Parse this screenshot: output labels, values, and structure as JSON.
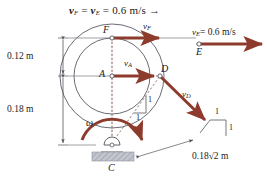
{
  "figure": {
    "title": {
      "full": "vF = vE = 0.6 m/s →",
      "v1": "v",
      "v1_sub": "F",
      "eq1": "=",
      "v2": "v",
      "v2_sub": "E",
      "eq2": "=",
      "value": "0.6 m/s →"
    },
    "dimensions": [
      {
        "name": "upper",
        "label": "0.12 m"
      },
      {
        "name": "lower",
        "label": "0.18 m"
      }
    ],
    "points": [
      {
        "id": "F",
        "label": "F"
      },
      {
        "id": "A",
        "label": "A"
      },
      {
        "id": "D",
        "label": "D"
      },
      {
        "id": "E",
        "label": "E"
      },
      {
        "id": "C",
        "label": "C"
      }
    ],
    "velocities": [
      {
        "id": "vF",
        "symbol": "v",
        "sub": "F"
      },
      {
        "id": "vA",
        "symbol": "v",
        "sub": "A"
      },
      {
        "id": "vD",
        "symbol": "v",
        "sub": "D"
      },
      {
        "id": "vE",
        "symbol": "v",
        "sub": "E",
        "value": "= 0.6 m/s"
      }
    ],
    "omega": {
      "symbol": "ω"
    },
    "slope_triangles": [
      {
        "id": "inner",
        "rise": "1",
        "run": "1"
      },
      {
        "id": "outer",
        "rise": "1",
        "run": "1"
      }
    ],
    "distance_label": {
      "text": "0.18√2 m",
      "value": "0.18",
      "radical": "√2 m"
    },
    "colors": {
      "arrow": "#8d3b2c",
      "arrow_dark": "#7e3326",
      "outline": "#5a5a66",
      "dim_line": "#6b6b73",
      "dashed": "#8d6b66",
      "ground": "#b9bcc6",
      "text": "#1a1a1a"
    }
  }
}
